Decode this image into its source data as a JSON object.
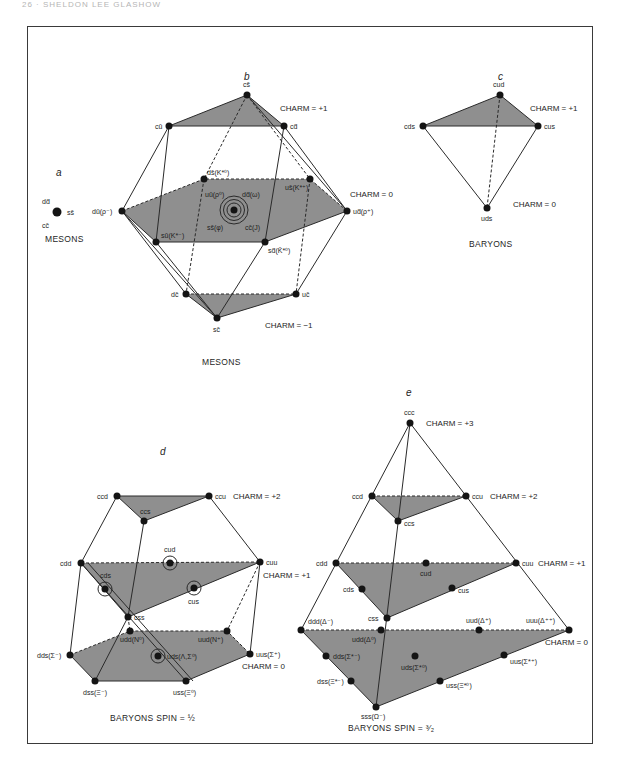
{
  "running_head": "26 · SHELDON LEE GLASHOW",
  "colors": {
    "face_fill": "#8f8f8f",
    "line": "#2a2a2a",
    "node": "#141414"
  },
  "panels": {
    "a": {
      "letter": "a",
      "nodes": [
        {
          "labels": [
            "dd̄",
            "ss̄",
            "cc̄"
          ]
        }
      ],
      "label_dd": "dd̄",
      "label_ss": "ss̄",
      "label_cc": "cc̄",
      "caption": "MESONS"
    },
    "b": {
      "letter": "b",
      "charm_labels": [
        "CHARM = +1",
        "CHARM = 0",
        "CHARM = −1"
      ],
      "nodes": {
        "cs": "cs̄",
        "cu": "cū",
        "cd": "cd̄",
        "ds": "ds̄(K*⁰)",
        "us": "us̄(K*⁺)",
        "du": "dū(ρ⁻)",
        "ud": "ud̄(ρ⁺)",
        "uu": "uū(ρ⁰)",
        "dd": "dd̄(ω)",
        "ss": "ss̄(φ)",
        "cc": "cc̄(J)",
        "su": "sū(K*⁻)",
        "sd": "sd̄(K̄*⁰)",
        "dc": "dc̄",
        "uc": "uc̄",
        "sc": "sc̄"
      },
      "caption": "MESONS"
    },
    "c": {
      "letter": "c",
      "charm_labels": [
        "CHARM = +1",
        "CHARM = 0"
      ],
      "nodes": {
        "cud": "cud",
        "cds": "cds",
        "cus": "cus",
        "uds": "uds"
      },
      "caption": "BARYONS"
    },
    "d": {
      "letter": "d",
      "charm_labels": [
        "CHARM = +2",
        "CHARM = +1",
        "CHARM = 0"
      ],
      "nodes": {
        "ccd": "ccd",
        "ccu": "ccu",
        "ccs": "ccs",
        "cdd": "cdd",
        "cud": "cud",
        "cuu": "cuu",
        "cds": "cds",
        "cus": "cus",
        "css": "css",
        "udd": "udd(N⁰)",
        "uud": "uud(N⁺)",
        "dds": "dds(Σ⁻)",
        "uds": "uds(Λ,Σ⁰)",
        "uus": "uus(Σ⁺)",
        "dss": "dss(Ξ⁻)",
        "uss": "uss(Ξ⁰)"
      },
      "caption": "BARYONS  SPIN = ½"
    },
    "e": {
      "letter": "e",
      "charm_labels": [
        "CHARM = +3",
        "CHARM = +2",
        "CHARM = +1",
        "CHARM = 0"
      ],
      "nodes": {
        "ccc": "ccc",
        "ccd": "ccd",
        "ccu": "ccu",
        "ccs": "ccs",
        "cdd": "cdd",
        "cud": "cud",
        "cuu": "cuu",
        "cds": "cds",
        "cus": "cus",
        "css": "css",
        "ddd": "ddd(Δ⁻)",
        "udd": "udd(Δ⁰)",
        "uud": "uud(Δ⁺)",
        "uuu": "uuu(Δ⁺⁺)",
        "dds": "dds(Σ*⁻)",
        "uds": "uds(Σ*⁰)",
        "uus": "uus(Σ*⁺)",
        "dss": "dss(Ξ*⁻)",
        "uss": "uss(Ξ*⁰)",
        "sss": "sss(Ω⁻)"
      },
      "caption": "BARYONS  SPIN = ³⁄₂"
    }
  }
}
